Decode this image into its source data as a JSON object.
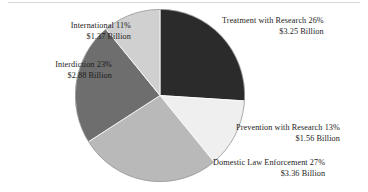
{
  "figure": {
    "background_color": "#ffffff",
    "rule_color": "#d8d8d8"
  },
  "chart_data": {
    "type": "pie",
    "title": "",
    "subtitle": "",
    "xlabel": "",
    "ylabel": "",
    "legend_position": "none",
    "grid": false,
    "units": "Billion US Dollars",
    "total_value": 12.42,
    "start_angle_deg": 0,
    "direction": "clockwise",
    "categories": [
      "Treatment with Research",
      "Prevention with Research",
      "Domestic Law Enforcement",
      "Interdiction",
      "International"
    ],
    "values": [
      26,
      13,
      27,
      23,
      11
    ],
    "amounts": [
      3.25,
      1.56,
      3.36,
      2.88,
      1.37
    ],
    "colors": [
      "#2b2b2b",
      "#efefef",
      "#b9b9b9",
      "#6e6e6e",
      "#d0d0d0"
    ],
    "slices": [
      {
        "name": "Treatment with Research",
        "percent": 26,
        "amount": 3.25,
        "color": "#2b2b2b",
        "line1": "Treatment with Research 26%",
        "line2": "$3.25 Billion"
      },
      {
        "name": "Prevention with Research",
        "percent": 13,
        "amount": 1.56,
        "color": "#efefef",
        "line1": "Prevention with Research 13%",
        "line2": "$1.56 Billion"
      },
      {
        "name": "Domestic Law Enforcement",
        "percent": 27,
        "amount": 3.36,
        "color": "#b9b9b9",
        "line1": "Domestic Law Enforcement 27%",
        "line2": "$3.36 Billion"
      },
      {
        "name": "Interdiction",
        "percent": 23,
        "amount": 2.88,
        "color": "#6e6e6e",
        "line1": "Interdiction 23%",
        "line2": "$2.88 Billion"
      },
      {
        "name": "International",
        "percent": 11,
        "amount": 1.37,
        "color": "#d0d0d0",
        "line1": "International 11%",
        "line2": "$1.37 Billion"
      }
    ]
  },
  "labels": {
    "treatment": {
      "line1": "Treatment with Research 26%",
      "line2": "$3.25 Billion"
    },
    "international": {
      "line1": "International 11%",
      "line2": "$1.37 Billion"
    },
    "interdiction": {
      "line1": "Interdiction 23%",
      "line2": "$2.88 Billion"
    },
    "prevention": {
      "line1": "Prevention with Research 13%",
      "line2": "$1.56 Billion"
    },
    "domestic": {
      "line1": "Domestic Law Enforcement 27%",
      "line2": "$3.36 Billion"
    }
  }
}
